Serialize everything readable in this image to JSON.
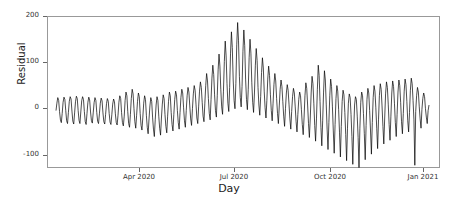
{
  "chart_data": {
    "type": "line",
    "title": "",
    "xlabel": "Day",
    "ylabel": "Residual",
    "grid": false,
    "legend": "none",
    "line_color": "#000000",
    "line_width": 0.7,
    "xlim_labels": [
      "Mar 2020",
      "Jan 2021"
    ],
    "ylim": [
      -140,
      200
    ],
    "yticks": [
      200,
      100,
      0,
      -100
    ],
    "ytick_labels": [
      "200",
      "100",
      "0",
      "-100"
    ],
    "xticks": [
      "Apr 2020",
      "Jul 2020",
      "Oct 2020",
      "Jan 2021"
    ],
    "xtick_positions_px": [
      139,
      234,
      330,
      423
    ],
    "ytick_positions_px": [
      16,
      62,
      108,
      155
    ],
    "series": [
      {
        "name": "Residual",
        "values": [
          -2,
          14,
          26,
          20,
          -4,
          -22,
          -28,
          -8,
          16,
          27,
          22,
          -2,
          -24,
          -30,
          -6,
          18,
          28,
          23,
          -3,
          -25,
          -31,
          -7,
          17,
          29,
          24,
          -2,
          -23,
          -30,
          -5,
          19,
          28,
          22,
          -4,
          -26,
          -32,
          -8,
          16,
          27,
          21,
          -5,
          -24,
          -29,
          -7,
          15,
          26,
          20,
          -6,
          -25,
          -30,
          -9,
          14,
          25,
          19,
          -7,
          -26,
          -31,
          -10,
          13,
          24,
          18,
          -8,
          -27,
          -32,
          -11,
          12,
          23,
          17,
          -9,
          -28,
          -33,
          -12,
          16,
          30,
          24,
          -6,
          -28,
          -35,
          -14,
          20,
          38,
          30,
          -4,
          -30,
          -38,
          -10,
          24,
          44,
          34,
          2,
          -26,
          -40,
          -12,
          18,
          36,
          28,
          -8,
          -34,
          -44,
          -16,
          14,
          30,
          22,
          -12,
          -38,
          -52,
          -20,
          8,
          26,
          18,
          -16,
          -42,
          -58,
          -22,
          10,
          28,
          20,
          -14,
          -40,
          -55,
          -18,
          12,
          32,
          24,
          -10,
          -36,
          -50,
          -14,
          18,
          38,
          30,
          -6,
          -32,
          -46,
          -10,
          22,
          40,
          32,
          -2,
          -28,
          -42,
          -6,
          26,
          44,
          36,
          4,
          -24,
          -38,
          -2,
          30,
          48,
          38,
          8,
          -20,
          -34,
          2,
          34,
          52,
          42,
          12,
          -18,
          -30,
          6,
          40,
          60,
          48,
          16,
          -14,
          -26,
          14,
          52,
          78,
          62,
          24,
          -8,
          -22,
          22,
          68,
          96,
          76,
          32,
          -2,
          -16,
          30,
          86,
          120,
          94,
          44,
          6,
          -10,
          40,
          104,
          148,
          116,
          56,
          14,
          -4,
          48,
          122,
          168,
          134,
          64,
          20,
          2,
          56,
          140,
          188,
          150,
          72,
          26,
          6,
          50,
          126,
          172,
          138,
          66,
          22,
          0,
          44,
          112,
          152,
          122,
          58,
          16,
          -6,
          36,
          96,
          132,
          106,
          48,
          10,
          -12,
          28,
          80,
          112,
          90,
          40,
          4,
          -18,
          20,
          66,
          94,
          74,
          32,
          -2,
          -24,
          14,
          54,
          78,
          62,
          24,
          -8,
          -30,
          8,
          44,
          64,
          50,
          18,
          -14,
          -36,
          2,
          36,
          54,
          42,
          12,
          -20,
          -42,
          -4,
          28,
          46,
          36,
          6,
          -26,
          -48,
          -10,
          22,
          38,
          30,
          0,
          -32,
          -54,
          -16,
          30,
          58,
          46,
          10,
          -30,
          -60,
          -18,
          36,
          72,
          56,
          14,
          -34,
          -68,
          -20,
          44,
          96,
          74,
          18,
          -38,
          -78,
          -24,
          38,
          84,
          64,
          12,
          -42,
          -86,
          -28,
          30,
          66,
          50,
          6,
          -46,
          -94,
          -32,
          24,
          52,
          40,
          0,
          -50,
          -102,
          -36,
          18,
          42,
          32,
          -6,
          -54,
          -110,
          -40,
          14,
          34,
          26,
          -10,
          -58,
          -118,
          -44,
          10,
          28,
          22,
          -14,
          -60,
          -125,
          -40,
          16,
          38,
          30,
          -8,
          -52,
          -108,
          -34,
          22,
          46,
          36,
          -2,
          -46,
          -96,
          -28,
          26,
          52,
          40,
          4,
          -40,
          -84,
          -22,
          30,
          56,
          44,
          8,
          -36,
          -74,
          -18,
          34,
          60,
          48,
          12,
          -32,
          -66,
          -14,
          36,
          62,
          50,
          14,
          -28,
          -58,
          -10,
          38,
          64,
          52,
          16,
          -26,
          -52,
          -8,
          40,
          66,
          54,
          18,
          -24,
          -48,
          -6,
          42,
          68,
          56,
          20,
          -22,
          -120,
          -4,
          30,
          48,
          38,
          6,
          -20,
          -40,
          0,
          24,
          36,
          28,
          2,
          -16,
          -30,
          -2,
          10
        ]
      }
    ],
    "annotations": []
  }
}
